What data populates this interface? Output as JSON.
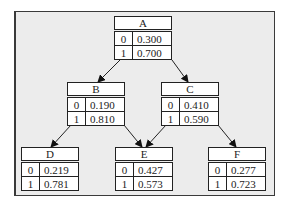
{
  "diagram": {
    "type": "bayesian-network",
    "nodes": [
      {
        "id": "A",
        "label": "A",
        "rows": [
          {
            "state": "0",
            "prob": "0.300"
          },
          {
            "state": "1",
            "prob": "0.700"
          }
        ]
      },
      {
        "id": "B",
        "label": "B",
        "rows": [
          {
            "state": "0",
            "prob": "0.190"
          },
          {
            "state": "1",
            "prob": "0.810"
          }
        ]
      },
      {
        "id": "C",
        "label": "C",
        "rows": [
          {
            "state": "0",
            "prob": "0.410"
          },
          {
            "state": "1",
            "prob": "0.590"
          }
        ]
      },
      {
        "id": "D",
        "label": "D",
        "rows": [
          {
            "state": "0",
            "prob": "0.219"
          },
          {
            "state": "1",
            "prob": "0.781"
          }
        ]
      },
      {
        "id": "E",
        "label": "E",
        "rows": [
          {
            "state": "0",
            "prob": "0.427"
          },
          {
            "state": "1",
            "prob": "0.573"
          }
        ]
      },
      {
        "id": "F",
        "label": "F",
        "rows": [
          {
            "state": "0",
            "prob": "0.277"
          },
          {
            "state": "1",
            "prob": "0.723"
          }
        ]
      }
    ],
    "edges": [
      {
        "from": "A",
        "to": "B"
      },
      {
        "from": "A",
        "to": "C"
      },
      {
        "from": "B",
        "to": "D"
      },
      {
        "from": "B",
        "to": "E"
      },
      {
        "from": "C",
        "to": "E"
      },
      {
        "from": "C",
        "to": "F"
      }
    ]
  }
}
